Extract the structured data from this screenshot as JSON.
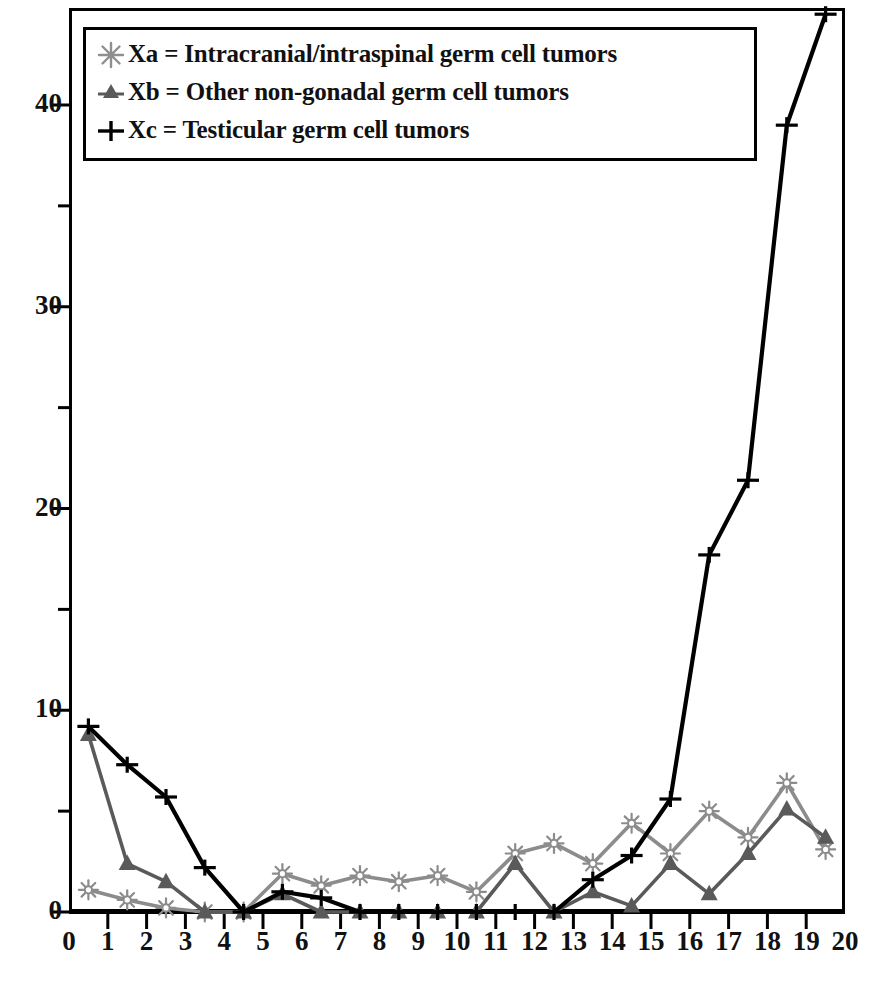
{
  "chart_data": {
    "type": "line",
    "title": "",
    "xlabel": "",
    "ylabel": "",
    "xlim": [
      0,
      20
    ],
    "ylim": [
      0,
      44.8
    ],
    "x_ticks": [
      "0",
      "1",
      "2",
      "3",
      "4",
      "5",
      "6",
      "7",
      "8",
      "9",
      "10",
      "11",
      "12",
      "13",
      "14",
      "15",
      "16",
      "17",
      "18",
      "19",
      "20"
    ],
    "y_ticks": [
      "0",
      "10",
      "20",
      "30",
      "40"
    ],
    "y_minor_ticks": [
      5,
      15,
      25,
      35
    ],
    "grid": false,
    "legend_position": "top-left",
    "x": [
      0.5,
      1.5,
      2.5,
      3.5,
      4.5,
      5.5,
      6.5,
      7.5,
      8.5,
      9.5,
      10.5,
      11.5,
      12.5,
      13.5,
      14.5,
      15.5,
      16.5,
      17.5,
      18.5,
      19.5
    ],
    "series": [
      {
        "name": "Xa",
        "label": "Xa = Intracranial/intraspinal germ cell tumors",
        "color": "#8c8c8c",
        "marker": "starburst",
        "values": [
          1.1,
          0.6,
          0.2,
          0.0,
          0.0,
          1.9,
          1.3,
          1.8,
          1.5,
          1.8,
          1.0,
          2.9,
          3.4,
          2.4,
          4.4,
          2.9,
          5.0,
          3.7,
          6.4,
          3.1
        ]
      },
      {
        "name": "Xb",
        "label": "Xb = Other non-gonadal germ cell tumors",
        "color": "#5a5a5a",
        "marker": "triangle",
        "values": [
          8.8,
          2.4,
          1.5,
          0.0,
          0.0,
          0.9,
          0.0,
          0.0,
          0.0,
          0.0,
          0.0,
          2.4,
          0.0,
          1.0,
          0.3,
          2.4,
          0.9,
          2.9,
          5.1,
          3.7
        ]
      },
      {
        "name": "Xc",
        "label": "Xc = Testicular germ cell tumors",
        "color": "#000000",
        "marker": "plus",
        "values": [
          9.2,
          7.3,
          5.7,
          2.2,
          0.0,
          1.0,
          0.7,
          0.0,
          0.0,
          0.0,
          0.0,
          0.0,
          0.0,
          1.6,
          2.8,
          5.6,
          17.7,
          21.4,
          39.0,
          44.5
        ]
      }
    ]
  },
  "legend": {
    "entries": [
      {
        "marker_name": "starburst-marker-icon",
        "text": "Xa = Intracranial/intraspinal germ cell tumors"
      },
      {
        "marker_name": "triangle-marker-icon",
        "text": "Xb = Other non-gonadal germ cell tumors"
      },
      {
        "marker_name": "plus-marker-icon",
        "text": "Xc = Testicular germ cell tumors"
      }
    ]
  }
}
